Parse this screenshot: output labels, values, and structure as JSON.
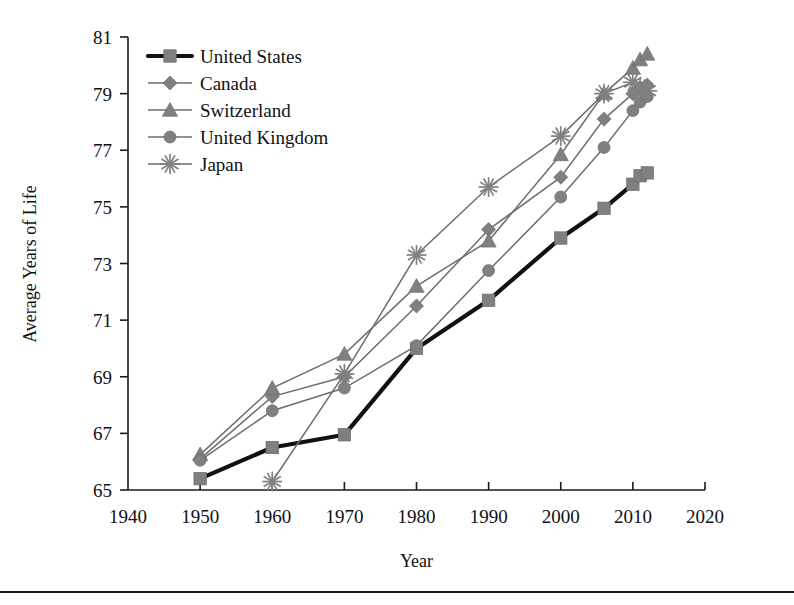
{
  "chart_data": {
    "type": "line",
    "title": "",
    "xlabel": "Year",
    "ylabel": "Average Years of Life",
    "xlim": [
      1940,
      2020
    ],
    "ylim": [
      65,
      81
    ],
    "xticks": [
      1940,
      1950,
      1960,
      1970,
      1980,
      1990,
      2000,
      2010,
      2020
    ],
    "yticks": [
      65,
      67,
      69,
      71,
      73,
      75,
      77,
      79,
      81
    ],
    "grid": false,
    "legend_position": "top-left-inside",
    "series": [
      {
        "name": "United States",
        "marker": "square",
        "emphasis": true,
        "x": [
          1950,
          1960,
          1970,
          1980,
          1990,
          2000,
          2006,
          2010,
          2011,
          2012
        ],
        "values": [
          65.4,
          66.5,
          66.95,
          70.0,
          71.7,
          73.9,
          74.95,
          75.8,
          76.1,
          76.2
        ]
      },
      {
        "name": "Canada",
        "marker": "diamond",
        "emphasis": false,
        "x": [
          1950,
          1960,
          1970,
          1980,
          1990,
          2000,
          2006,
          2010,
          2011,
          2012
        ],
        "values": [
          66.1,
          68.3,
          69.0,
          71.5,
          74.2,
          76.05,
          78.1,
          79.0,
          79.2,
          79.3
        ]
      },
      {
        "name": "Switzerland",
        "marker": "triangle",
        "emphasis": false,
        "x": [
          1950,
          1960,
          1970,
          1980,
          1990,
          2000,
          2006,
          2010,
          2011,
          2012
        ],
        "values": [
          66.25,
          68.6,
          69.8,
          72.2,
          73.8,
          76.85,
          79.0,
          79.9,
          80.2,
          80.4
        ]
      },
      {
        "name": "United Kingdom",
        "marker": "circle",
        "emphasis": false,
        "x": [
          1950,
          1960,
          1970,
          1980,
          1990,
          2000,
          2006,
          2010,
          2011,
          2012
        ],
        "values": [
          66.05,
          67.8,
          68.6,
          70.1,
          72.75,
          75.35,
          77.1,
          78.4,
          78.7,
          78.9
        ]
      },
      {
        "name": "Japan",
        "marker": "asterisk",
        "emphasis": false,
        "x": [
          1960,
          1970,
          1980,
          1990,
          2000,
          2006,
          2010,
          2011,
          2012
        ],
        "values": [
          65.3,
          69.1,
          73.3,
          75.7,
          77.5,
          79.0,
          79.4,
          79.2,
          79.1
        ]
      }
    ]
  }
}
